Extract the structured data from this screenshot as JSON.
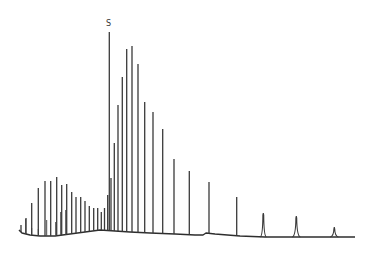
{
  "chart_data": {
    "type": "line",
    "title": "",
    "subtitle": "",
    "xlabel": "",
    "ylabel": "",
    "annotations": [
      {
        "text": "S",
        "x_px": 109,
        "y_px": 25,
        "refers_to": "tallest peak (standard)"
      }
    ],
    "grid": false,
    "legend": null,
    "units": "pixel coordinates (y increases downward; baseline ~y=232)",
    "peaks": [
      {
        "x": 21,
        "top": 225
      },
      {
        "x": 26,
        "top": 218
      },
      {
        "x": 31.7,
        "top": 203
      },
      {
        "x": 38.3,
        "top": 188
      },
      {
        "x": 45,
        "top": 181
      },
      {
        "x": 50.7,
        "top": 181
      },
      {
        "x": 56.7,
        "top": 177
      },
      {
        "x": 61.7,
        "top": 185
      },
      {
        "x": 66.7,
        "top": 184
      },
      {
        "x": 71.7,
        "top": 192
      },
      {
        "x": 76,
        "top": 197
      },
      {
        "x": 80.7,
        "top": 197
      },
      {
        "x": 85,
        "top": 201
      },
      {
        "x": 89.3,
        "top": 206
      },
      {
        "x": 93.7,
        "top": 208
      },
      {
        "x": 97.7,
        "top": 208
      },
      {
        "x": 101.3,
        "top": 212
      },
      {
        "x": 104.5,
        "top": 208
      },
      {
        "x": 107.7,
        "top": 195
      },
      {
        "x": 109.3,
        "top": 32,
        "label": "S"
      },
      {
        "x": 111,
        "top": 178
      },
      {
        "x": 114.3,
        "top": 143
      },
      {
        "x": 118,
        "top": 105
      },
      {
        "x": 122.3,
        "top": 77
      },
      {
        "x": 126.7,
        "top": 49
      },
      {
        "x": 132,
        "top": 46
      },
      {
        "x": 138,
        "top": 64
      },
      {
        "x": 144.7,
        "top": 102
      },
      {
        "x": 153,
        "top": 112
      },
      {
        "x": 162.7,
        "top": 129
      },
      {
        "x": 174,
        "top": 159
      },
      {
        "x": 189.3,
        "top": 171
      },
      {
        "x": 209,
        "top": 182
      },
      {
        "x": 236.7,
        "top": 197
      },
      {
        "x": 263.3,
        "top": 213,
        "width": 3
      },
      {
        "x": 296.3,
        "top": 216,
        "width": 4
      },
      {
        "x": 334.3,
        "top": 227,
        "width": 4
      }
    ],
    "minor_peaks": [
      {
        "x": 25.7,
        "top": 219
      },
      {
        "x": 31.7,
        "top": 228
      },
      {
        "x": 38.3,
        "top": 229
      },
      {
        "x": 46.7,
        "top": 220
      },
      {
        "x": 55.7,
        "top": 222
      },
      {
        "x": 60.7,
        "top": 212
      },
      {
        "x": 65.7,
        "top": 210
      }
    ],
    "baseline": [
      [
        19,
        230
      ],
      [
        22,
        233
      ],
      [
        30,
        235
      ],
      [
        40,
        236
      ],
      [
        55,
        236
      ],
      [
        70,
        234
      ],
      [
        85,
        232
      ],
      [
        100,
        230
      ],
      [
        115,
        231
      ],
      [
        130,
        232
      ],
      [
        150,
        233
      ],
      [
        175,
        234
      ],
      [
        195,
        235
      ],
      [
        203,
        235
      ],
      [
        206,
        233
      ],
      [
        215,
        234
      ],
      [
        240,
        236
      ],
      [
        265,
        237
      ],
      [
        300,
        237
      ],
      [
        340,
        237
      ],
      [
        355,
        237
      ]
    ]
  }
}
